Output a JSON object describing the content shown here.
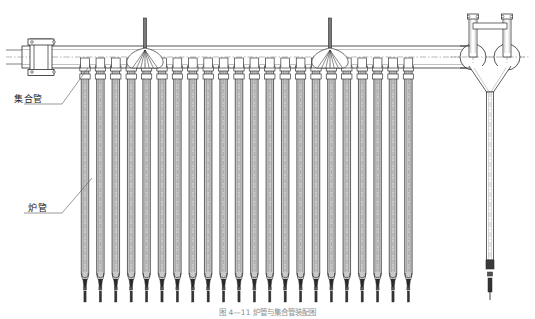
{
  "drawing": {
    "title": "炉管与集合管装配结构图",
    "caption": "图 4—11   炉管与集合管装配图",
    "line_color": "#2b2b2b",
    "fill_color": "#c9c9c9",
    "centerline_color": "#6e6e6e",
    "labels": [
      {
        "id": "header-pipe",
        "text": "集合管",
        "x": 14,
        "y": 98
      },
      {
        "id": "furnace-tube",
        "text": "炉管",
        "x": 28,
        "y": 207
      }
    ],
    "leaders": [
      {
        "id": "header-pipe-leader",
        "x1": 62,
        "y1": 104,
        "x2": 88,
        "y2": 68
      },
      {
        "id": "furnace-tube-leader",
        "x1": 62,
        "y1": 213,
        "x2": 92,
        "y2": 178
      }
    ],
    "header": {
      "x_left": 22,
      "x_right": 470,
      "y_top": 46,
      "y_bottom": 68,
      "centerline_y": 57,
      "flange": {
        "x": 30,
        "width": 22
      }
    },
    "tubes": {
      "count": 22,
      "x_start": 85,
      "pitch": 15.4,
      "y_top": 62,
      "y_ubend": 280,
      "y_stem_end": 302,
      "width": 7.5
    },
    "hangers": [
      {
        "id": "hanger-left",
        "x": 145,
        "y_rod_top": 18
      },
      {
        "id": "hanger-right",
        "x": 330,
        "y_rod_top": 18
      }
    ],
    "riser": {
      "id": "outlet-riser",
      "x": 490,
      "elbow_y": 57,
      "elbow_r": 13,
      "stub_offset": 17,
      "stub_top": 14,
      "y_bottom": 300
    }
  }
}
